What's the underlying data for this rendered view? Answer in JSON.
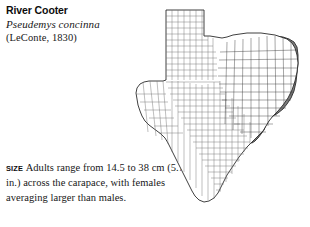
{
  "species": {
    "common_name": "River Cooter",
    "scientific_name": "Pseudemys concinna",
    "authority": "(LeConte, 1830)"
  },
  "size_account": {
    "label": "SIZE",
    "text": "Adults range from 14.5 to 38 cm (5.7–15 in.) across the carapace, with females averaging larger than males."
  },
  "map": {
    "name": "texas-county-range-map",
    "region": "Texas",
    "unit": "county",
    "range_fill_color": "#7d7d7d",
    "background_color": "#ffffff",
    "outline_color": "#2b2b2b",
    "county_line_color": "#6f6f6f",
    "range_description": "Eastern Texas"
  }
}
